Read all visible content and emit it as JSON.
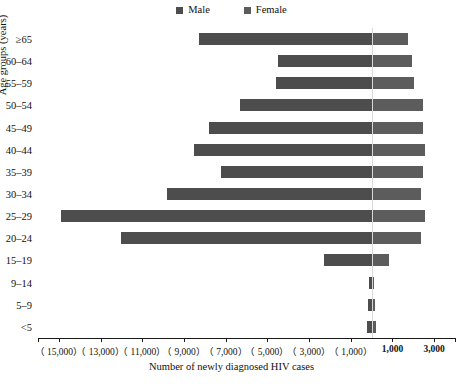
{
  "chart_data": {
    "type": "bar",
    "subtype": "population-pyramid",
    "title": "",
    "xlabel": "Number of newly diagnosed HIV cases",
    "ylabel": "Age groups (years)",
    "orientation": "horizontal",
    "grid": false,
    "legend_position": "top-center",
    "categories": [
      "≥65",
      "60–64",
      "55–59",
      "50–54",
      "45–49",
      "40–44",
      "35–39",
      "30–34",
      "25–29",
      "20–24",
      "15–19",
      "9–14",
      "5–9",
      "<5"
    ],
    "series": [
      {
        "name": "Male",
        "color": "#4d4d4d",
        "values": [
          8300,
          4500,
          4600,
          6300,
          7800,
          8500,
          7200,
          9800,
          14900,
          12000,
          2300,
          120,
          160,
          200
        ]
      },
      {
        "name": "Female",
        "color": "#5c5c5c",
        "values": [
          1700,
          1900,
          2000,
          2400,
          2400,
          2500,
          2400,
          2300,
          2500,
          2300,
          800,
          60,
          110,
          180
        ]
      }
    ],
    "x_ticks": [
      -15000,
      -13000,
      -11000,
      -9000,
      -7000,
      -5000,
      -3000,
      -1000,
      1000,
      3000
    ],
    "x_tick_labels": [
      "（ 15,000）",
      "（ 13,000）",
      "（ 11,000）",
      "（ 9,000）",
      "（ 7,000）",
      "（ 5,000）",
      "（ 3,000）",
      "（ 1,000）",
      "1,000",
      "3,000"
    ],
    "xlim": [
      -16000,
      4000
    ],
    "note": "Values left of zero are male counts shown in parentheses as positive magnitudes"
  },
  "legend": {
    "items": [
      {
        "label": "Male",
        "color": "#4d4d4d"
      },
      {
        "label": "Female",
        "color": "#5c5c5c"
      }
    ]
  },
  "axes": {
    "x_title": "Number of newly diagnosed HIV cases",
    "y_title": "Age groups (years)"
  }
}
